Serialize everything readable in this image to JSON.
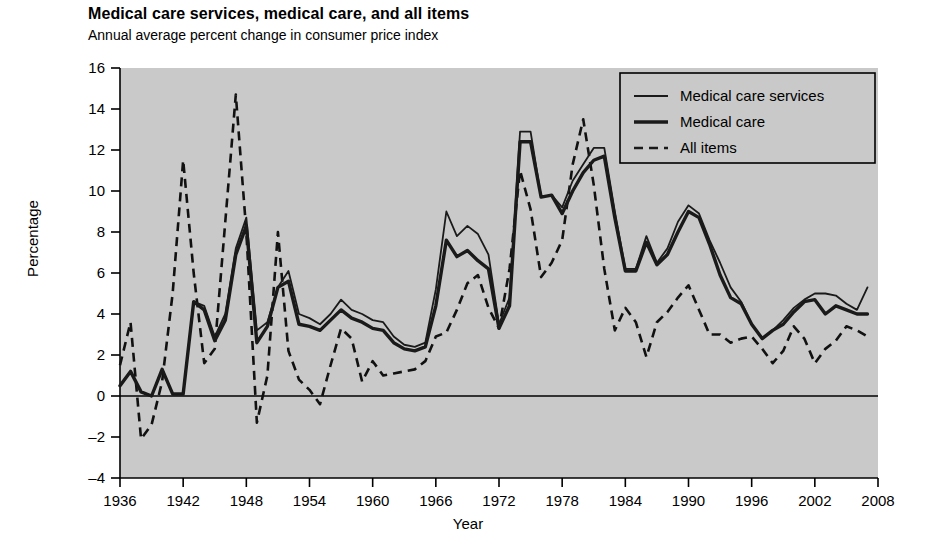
{
  "chart_data": {
    "type": "line",
    "title": "Medical care services, medical care, and all items",
    "subtitle": "Annual average percent change in consumer price index",
    "xlabel": "Year",
    "ylabel": "Percentage",
    "xlim": [
      1936,
      2008
    ],
    "ylim": [
      -4,
      16
    ],
    "xticks": [
      1936,
      1942,
      1948,
      1954,
      1960,
      1966,
      1972,
      1978,
      1984,
      1990,
      1996,
      2002,
      2008
    ],
    "yticks": [
      -4,
      -2,
      0,
      2,
      4,
      6,
      8,
      10,
      12,
      14,
      16
    ],
    "grid": false,
    "legend_position": "top-right",
    "zero_reference_line": 0,
    "x": [
      1936,
      1937,
      1938,
      1939,
      1940,
      1941,
      1942,
      1943,
      1944,
      1945,
      1946,
      1947,
      1948,
      1949,
      1950,
      1951,
      1952,
      1953,
      1954,
      1955,
      1956,
      1957,
      1958,
      1959,
      1960,
      1961,
      1962,
      1963,
      1964,
      1965,
      1966,
      1967,
      1968,
      1969,
      1970,
      1971,
      1972,
      1973,
      1974,
      1975,
      1976,
      1977,
      1978,
      1979,
      1980,
      1981,
      1982,
      1983,
      1984,
      1985,
      1986,
      1987,
      1988,
      1989,
      1990,
      1991,
      1992,
      1993,
      1994,
      1995,
      1996,
      1997,
      1998,
      1999,
      2000,
      2001,
      2002,
      2003,
      2004,
      2005,
      2006,
      2007
    ],
    "series": [
      {
        "name": "Medical care services",
        "style": "solid-thin",
        "color": "#1a1a1a",
        "values": [
          0.5,
          1.2,
          0.2,
          0.0,
          1.3,
          0.1,
          0.1,
          4.6,
          4.4,
          2.9,
          4.0,
          7.2,
          8.7,
          3.2,
          3.6,
          5.3,
          6.1,
          4.0,
          3.8,
          3.5,
          4.0,
          4.7,
          4.2,
          4.0,
          3.7,
          3.6,
          2.9,
          2.5,
          2.4,
          2.6,
          5.2,
          9.0,
          7.8,
          8.3,
          7.9,
          6.9,
          3.5,
          4.8,
          12.9,
          12.9,
          9.7,
          9.8,
          9.2,
          10.5,
          11.3,
          12.1,
          12.1,
          9.0,
          6.2,
          6.2,
          7.8,
          6.5,
          7.2,
          8.5,
          9.3,
          8.9,
          7.6,
          6.5,
          5.3,
          4.6,
          3.5,
          2.8,
          3.2,
          3.7,
          4.3,
          4.7,
          5.0,
          5.0,
          4.9,
          4.5,
          4.2,
          5.3
        ]
      },
      {
        "name": "Medical care",
        "style": "solid-thick",
        "color": "#1a1a1a",
        "values": [
          0.5,
          1.2,
          0.2,
          0.0,
          1.3,
          0.1,
          0.1,
          4.6,
          4.2,
          2.7,
          3.7,
          6.9,
          8.3,
          2.6,
          3.4,
          5.3,
          5.6,
          3.5,
          3.4,
          3.2,
          3.7,
          4.2,
          3.8,
          3.6,
          3.3,
          3.2,
          2.6,
          2.3,
          2.2,
          2.4,
          4.4,
          7.6,
          6.8,
          7.1,
          6.6,
          6.2,
          3.3,
          4.4,
          12.4,
          12.4,
          9.7,
          9.8,
          8.9,
          10.0,
          10.9,
          11.5,
          11.7,
          8.7,
          6.1,
          6.1,
          7.5,
          6.4,
          6.9,
          8.0,
          9.0,
          8.7,
          7.4,
          5.9,
          4.8,
          4.5,
          3.5,
          2.8,
          3.2,
          3.5,
          4.1,
          4.6,
          4.7,
          4.0,
          4.4,
          4.2,
          4.0,
          4.0
        ]
      },
      {
        "name": "All items",
        "style": "dashed",
        "color": "#111111",
        "values": [
          1.5,
          3.6,
          -2.1,
          -1.4,
          0.7,
          5.0,
          11.5,
          6.0,
          1.6,
          2.3,
          8.5,
          14.7,
          8.0,
          -1.3,
          1.0,
          8.0,
          2.2,
          0.8,
          0.3,
          -0.4,
          1.5,
          3.3,
          2.8,
          0.7,
          1.7,
          1.0,
          1.1,
          1.2,
          1.3,
          1.7,
          2.9,
          3.1,
          4.2,
          5.5,
          5.9,
          4.3,
          3.3,
          6.2,
          11.0,
          9.1,
          5.8,
          6.5,
          7.6,
          11.3,
          13.5,
          10.3,
          6.2,
          3.2,
          4.3,
          3.6,
          1.9,
          3.6,
          4.1,
          4.8,
          5.4,
          4.2,
          3.0,
          3.0,
          2.6,
          2.8,
          2.9,
          2.3,
          1.6,
          2.2,
          3.4,
          2.8,
          1.6,
          2.3,
          2.7,
          3.4,
          3.2,
          2.9
        ]
      }
    ]
  },
  "legend": {
    "items": [
      {
        "label": "Medical care services",
        "style": "solid-thin"
      },
      {
        "label": "Medical care",
        "style": "solid-thick"
      },
      {
        "label": "All items",
        "style": "dashed"
      }
    ]
  },
  "colors": {
    "plot_background": "#c9c9c9",
    "line": "#1a1a1a",
    "axis": "#000000",
    "page_background": "#ffffff"
  }
}
